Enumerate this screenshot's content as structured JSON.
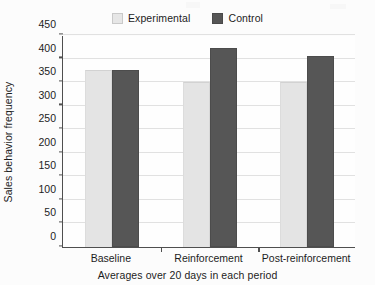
{
  "chart_data": {
    "type": "bar",
    "title": "",
    "subtitle": "",
    "xlabel": "Averages over 20 days in each period",
    "ylabel": "Sales behavior frequency",
    "categories": [
      "Baseline",
      "Reinforcement",
      "Post-reinforcement"
    ],
    "series": [
      {
        "name": "Experimental",
        "values": [
          375,
          350,
          350
        ],
        "color": "#e4e4e4"
      },
      {
        "name": "Control",
        "values": [
          375,
          423,
          406
        ],
        "color": "#565656"
      }
    ],
    "ylim": [
      0,
      450
    ],
    "ytick_step": 50,
    "yticks": [
      0,
      50,
      100,
      150,
      200,
      250,
      300,
      350,
      400,
      450
    ],
    "ytick_labels": [
      "0",
      "50",
      "100",
      "150",
      "200",
      "250",
      "300",
      "350",
      "400",
      "450"
    ],
    "grid": "horizontal",
    "legend_position": "top-center",
    "legend_entries": [
      "Experimental",
      "Control"
    ],
    "bar_mode": "grouped",
    "axis_color": "#4f4f4f",
    "gridline_color": "#e1e1e1",
    "plot_background": "#fefefe"
  },
  "legend": {
    "items": [
      {
        "label": "Experimental",
        "swatch": "legend-swatch-experimental"
      },
      {
        "label": "Control",
        "swatch": "legend-swatch-control"
      }
    ]
  },
  "axes": {
    "y_title": "Sales behavior frequency",
    "x_title": "Averages over 20 days in each period"
  }
}
